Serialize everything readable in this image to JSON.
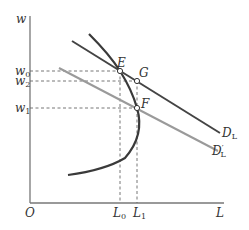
{
  "diagram": {
    "axes": {
      "y_label": "w",
      "x_label": "L",
      "origin_label": "O"
    },
    "y_ticks": [
      {
        "base": "w",
        "sub": "0"
      },
      {
        "base": "w",
        "sub": "2"
      },
      {
        "base": "w",
        "sub": "1"
      }
    ],
    "x_ticks": [
      {
        "base": "L",
        "sub": "0"
      },
      {
        "base": "L",
        "sub": "1"
      }
    ],
    "points": {
      "E": "E",
      "G": "G",
      "F": "F"
    },
    "curves": {
      "demand": {
        "base": "D",
        "sub": "L"
      },
      "demand_shifted": {
        "base": "D",
        "sub": "L",
        "prime": "′"
      },
      "supply": "backward-bending supply curve"
    },
    "colors": {
      "demand": "#444444",
      "demand_shifted": "#999999",
      "supply": "#3a3a3a",
      "axes": "#777777",
      "guide": "#666666"
    }
  }
}
